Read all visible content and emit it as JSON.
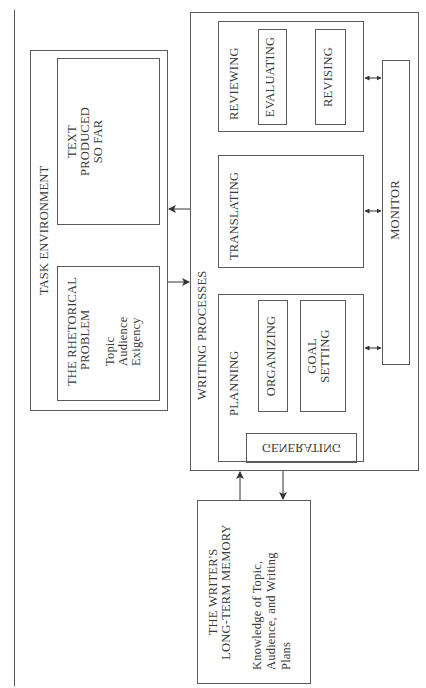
{
  "caption_fragment": "",
  "task_environment": {
    "title": "TASK ENVIRONMENT",
    "text_produced": {
      "line1": "TEXT",
      "line2": "PRODUCED",
      "line3": "SO FAR"
    },
    "rhetorical_problem": {
      "title_line1": "THE RHETORICAL",
      "title_line2": "PROBLEM",
      "items": [
        "Topic",
        "Audience",
        "Exigency"
      ]
    }
  },
  "writing_processes": {
    "title": "WRITING PROCESSES",
    "reviewing": {
      "title": "REVIEWING",
      "sub": [
        "EVALUATING",
        "REVISING"
      ]
    },
    "translating": {
      "title": "TRANSLATING"
    },
    "planning": {
      "title": "PLANNING",
      "organizing": "ORGANIZING",
      "goal_setting": {
        "line1": "GOAL",
        "line2": "SETTING"
      },
      "generating": "GENERATING"
    },
    "monitor": "MONITOR"
  },
  "long_term_memory": {
    "title_line1": "THE WRITER'S",
    "title_line2": "LONG-TERM MEMORY",
    "body_line1": "Knowledge of Topic,",
    "body_line2": "Audience, and Writing",
    "body_line3": "Plans"
  },
  "colors": {
    "line": "#5a5a5a",
    "text": "#3a3a3a",
    "background": "#ffffff"
  }
}
